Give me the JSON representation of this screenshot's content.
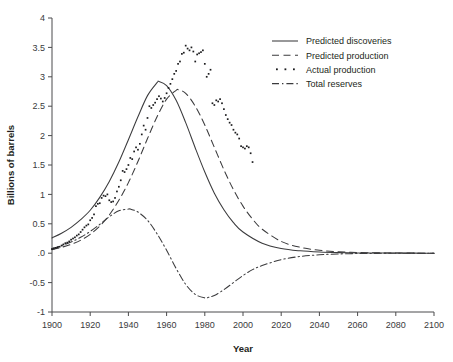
{
  "chart_data": {
    "type": "line",
    "title": "",
    "xlabel": "Year",
    "ylabel": "Billions of barrels",
    "xlim": [
      1900,
      2100
    ],
    "ylim": [
      -1,
      4
    ],
    "grid": false,
    "legend_position": "top-right",
    "xticks": [
      1900,
      1920,
      1940,
      1960,
      1980,
      2000,
      2020,
      2040,
      2060,
      2080,
      2100
    ],
    "xtick_labels": [
      "1900",
      "1920",
      "1940",
      "1960",
      "1980",
      "2000",
      "2020",
      "2040",
      "2060",
      "2080",
      "2100"
    ],
    "yticks": [
      4,
      3.5,
      3,
      2.5,
      2,
      1.5,
      1,
      0.5,
      0,
      -0.5,
      -1
    ],
    "ytick_labels": [
      "4",
      "3.5",
      "3",
      "2.5",
      "2",
      "1.5",
      "1",
      "0.5",
      ".0",
      "-0.5",
      "-1"
    ],
    "legend": [
      {
        "label": "Predicted discoveries",
        "style": "solid"
      },
      {
        "label": "Predicted production",
        "style": "dashed"
      },
      {
        "label": "Actual production",
        "style": "dotted"
      },
      {
        "label": "Total reserves",
        "style": "dashdot"
      }
    ],
    "series": [
      {
        "name": "Predicted discoveries",
        "style": "solid",
        "peak_year": 1956,
        "peak_value": 2.92,
        "x": [
          1900,
          1905,
          1910,
          1915,
          1920,
          1925,
          1930,
          1935,
          1940,
          1945,
          1950,
          1955,
          1956,
          1960,
          1965,
          1970,
          1975,
          1980,
          1985,
          1990,
          1995,
          2000,
          2010,
          2020,
          2030,
          2040,
          2050,
          2060,
          2070,
          2080,
          2090,
          2100
        ],
        "values": [
          0.26,
          0.34,
          0.44,
          0.57,
          0.73,
          0.95,
          1.22,
          1.55,
          1.93,
          2.32,
          2.68,
          2.9,
          2.92,
          2.85,
          2.6,
          2.22,
          1.79,
          1.38,
          1.02,
          0.74,
          0.52,
          0.36,
          0.17,
          0.08,
          0.04,
          0.02,
          0.01,
          0.005,
          0.003,
          0.002,
          0.001,
          0.0
        ]
      },
      {
        "name": "Predicted production",
        "style": "dashed",
        "peak_year": 1966,
        "peak_value": 2.78,
        "x": [
          1900,
          1905,
          1910,
          1915,
          1920,
          1925,
          1930,
          1935,
          1940,
          1945,
          1950,
          1955,
          1960,
          1965,
          1966,
          1970,
          1975,
          1980,
          1985,
          1990,
          1995,
          2000,
          2005,
          2010,
          2020,
          2030,
          2040,
          2050,
          2060,
          2070,
          2080,
          2090,
          2100
        ],
        "values": [
          0.06,
          0.1,
          0.15,
          0.22,
          0.32,
          0.46,
          0.65,
          0.9,
          1.2,
          1.56,
          1.95,
          2.32,
          2.62,
          2.77,
          2.78,
          2.72,
          2.5,
          2.18,
          1.8,
          1.42,
          1.08,
          0.8,
          0.58,
          0.41,
          0.2,
          0.1,
          0.05,
          0.025,
          0.012,
          0.006,
          0.003,
          0.001,
          0.0
        ]
      },
      {
        "name": "Total reserves",
        "style": "dashdot",
        "peak_year": 1941,
        "peak_value": 0.75,
        "trough_year": 1982,
        "trough_value": -0.75,
        "x": [
          1900,
          1905,
          1910,
          1915,
          1920,
          1925,
          1930,
          1935,
          1940,
          1941,
          1945,
          1950,
          1955,
          1960,
          1965,
          1970,
          1975,
          1980,
          1982,
          1985,
          1990,
          1995,
          2000,
          2005,
          2010,
          2020,
          2030,
          2040,
          2050,
          2060,
          2070,
          2080,
          2090,
          2100
        ],
        "values": [
          0.08,
          0.13,
          0.19,
          0.27,
          0.37,
          0.49,
          0.62,
          0.72,
          0.75,
          0.75,
          0.7,
          0.56,
          0.33,
          0.05,
          -0.26,
          -0.53,
          -0.7,
          -0.76,
          -0.75,
          -0.72,
          -0.62,
          -0.5,
          -0.38,
          -0.28,
          -0.21,
          -0.11,
          -0.055,
          -0.027,
          -0.013,
          -0.006,
          -0.003,
          -0.001,
          -0.0005,
          0.0
        ]
      }
    ],
    "scatter": {
      "name": "Actual production",
      "style": "dotted",
      "x": [
        1900,
        1901,
        1902,
        1903,
        1904,
        1905,
        1906,
        1907,
        1908,
        1909,
        1910,
        1911,
        1912,
        1913,
        1914,
        1915,
        1916,
        1917,
        1918,
        1919,
        1920,
        1921,
        1922,
        1923,
        1924,
        1925,
        1926,
        1927,
        1928,
        1929,
        1930,
        1931,
        1932,
        1933,
        1934,
        1935,
        1936,
        1937,
        1938,
        1939,
        1940,
        1941,
        1942,
        1943,
        1944,
        1945,
        1946,
        1947,
        1948,
        1949,
        1950,
        1951,
        1952,
        1953,
        1954,
        1955,
        1956,
        1957,
        1958,
        1959,
        1960,
        1961,
        1962,
        1963,
        1964,
        1965,
        1966,
        1967,
        1968,
        1969,
        1970,
        1971,
        1972,
        1973,
        1974,
        1975,
        1976,
        1977,
        1978,
        1979,
        1980,
        1981,
        1982,
        1983,
        1984,
        1985,
        1986,
        1987,
        1988,
        1989,
        1990,
        1991,
        1992,
        1993,
        1994,
        1995,
        1996,
        1997,
        1998,
        1999,
        2000,
        2001,
        2002,
        2003,
        2004,
        2005
      ],
      "values": [
        0.07,
        0.08,
        0.09,
        0.1,
        0.11,
        0.13,
        0.15,
        0.17,
        0.18,
        0.2,
        0.23,
        0.25,
        0.27,
        0.3,
        0.32,
        0.36,
        0.4,
        0.44,
        0.47,
        0.49,
        0.56,
        0.6,
        0.66,
        0.8,
        0.84,
        0.85,
        0.94,
        0.98,
        0.97,
        1.0,
        0.9,
        0.87,
        0.88,
        0.94,
        1.05,
        1.13,
        1.24,
        1.4,
        1.38,
        1.43,
        1.5,
        1.62,
        1.6,
        1.73,
        1.8,
        1.76,
        1.86,
        2.02,
        2.17,
        2.1,
        2.3,
        2.5,
        2.47,
        2.52,
        2.56,
        2.62,
        2.67,
        2.63,
        2.58,
        2.64,
        2.72,
        2.81,
        2.88,
        2.96,
        3.05,
        3.1,
        3.22,
        3.26,
        3.39,
        3.41,
        3.53,
        3.48,
        3.45,
        3.5,
        3.43,
        3.26,
        3.38,
        3.4,
        3.42,
        3.45,
        3.22,
        3.0,
        3.05,
        3.12,
        2.55,
        2.52,
        2.6,
        2.58,
        2.62,
        2.55,
        2.45,
        2.35,
        2.28,
        2.22,
        2.18,
        2.1,
        2.05,
        2.02,
        1.95,
        1.82,
        1.8,
        1.78,
        1.82,
        1.8,
        1.7,
        1.55
      ]
    }
  }
}
